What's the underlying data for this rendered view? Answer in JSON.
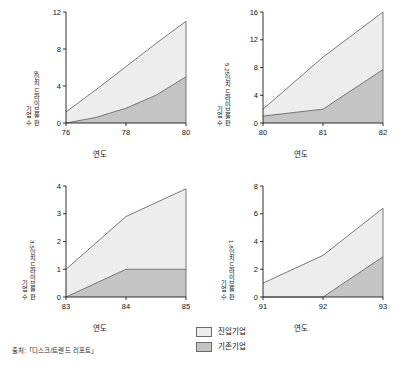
{
  "figure": {
    "source_note": "출처:「디스크/트렌드 리포트」",
    "legend": {
      "position": "bottom-center",
      "items": [
        {
          "label": "진입기업",
          "color": "#ededed",
          "key": "entrant"
        },
        {
          "label": "기존기업",
          "color": "#c4c4c4",
          "key": "incumbent"
        }
      ]
    },
    "colors": {
      "entrant_fill": "#ededed",
      "incumbent_fill": "#c4c4c4",
      "line": "#6b6b6b",
      "axis": "#1a1a1a",
      "text": "#111111"
    }
  },
  "chart_data": [
    {
      "type": "area",
      "id": "chart-8inch",
      "title": "",
      "ylabel_line1": "8인치 드라이브를 판",
      "ylabel_line2": "기업 수",
      "xlabel": "연도",
      "x": [
        76,
        77,
        78,
        79,
        80
      ],
      "xticks": [
        76,
        78,
        80
      ],
      "xticklabels": [
        "76",
        "78",
        "80"
      ],
      "yticks": [
        0,
        4,
        8,
        12
      ],
      "yticklabels": [
        "0",
        "4",
        "8",
        "12"
      ],
      "xlim": [
        76,
        80
      ],
      "ylim": [
        0,
        12
      ],
      "grid": false,
      "series": [
        {
          "name": "기존기업",
          "key": "incumbent",
          "values": [
            0.0,
            0.6,
            1.6,
            3.0,
            5.0
          ]
        },
        {
          "name": "진입기업",
          "key": "entrant",
          "values": [
            1.2,
            3.6,
            6.1,
            8.6,
            11.0
          ]
        }
      ],
      "stack_note": "entrant values are cumulative totals (top of stack)"
    },
    {
      "type": "area",
      "id": "chart-5-25inch",
      "title": "",
      "ylabel_line1": "5.25인치 드라이브를 판",
      "ylabel_line2": "기업 수",
      "xlabel": "연도",
      "x": [
        80,
        81,
        82
      ],
      "xticks": [
        80,
        81,
        82
      ],
      "xticklabels": [
        "80",
        "81",
        "82"
      ],
      "yticks": [
        0,
        4,
        8,
        12,
        16
      ],
      "yticklabels": [
        "0",
        "4",
        "8",
        "12",
        "16"
      ],
      "xlim": [
        80,
        82
      ],
      "ylim": [
        0,
        16
      ],
      "grid": false,
      "series": [
        {
          "name": "기존기업",
          "key": "incumbent",
          "values": [
            1.0,
            2.0,
            7.7
          ]
        },
        {
          "name": "진입기업",
          "key": "entrant",
          "values": [
            2.0,
            9.5,
            16.0
          ]
        }
      ],
      "stack_note": "entrant values are cumulative totals (top of stack)"
    },
    {
      "type": "area",
      "id": "chart-3-5inch",
      "title": "",
      "ylabel_line1": "3.5인치 드라이브를 판",
      "ylabel_line2": "기업 수",
      "xlabel": "연도",
      "x": [
        83,
        84,
        85
      ],
      "xticks": [
        83,
        84,
        85
      ],
      "xticklabels": [
        "83",
        "84",
        "85"
      ],
      "yticks": [
        0,
        1,
        2,
        3,
        4
      ],
      "yticklabels": [
        "0",
        "1",
        "2",
        "3",
        "4"
      ],
      "xlim": [
        83,
        85
      ],
      "ylim": [
        0,
        4
      ],
      "grid": false,
      "series": [
        {
          "name": "기존기업",
          "key": "incumbent",
          "values": [
            0.0,
            1.0,
            1.0
          ]
        },
        {
          "name": "진입기업",
          "key": "entrant",
          "values": [
            1.0,
            2.9,
            3.9
          ]
        }
      ],
      "stack_note": "entrant values are cumulative totals (top of stack)"
    },
    {
      "type": "area",
      "id": "chart-1-8inch",
      "title": "",
      "ylabel_line1": "1.8인치 드라이브를 판",
      "ylabel_line2": "기업 수",
      "xlabel": "연도",
      "x": [
        91,
        92,
        93
      ],
      "xticks": [
        91,
        92,
        93
      ],
      "xticklabels": [
        "91",
        "92",
        "93"
      ],
      "yticks": [
        0,
        2,
        4,
        6,
        8
      ],
      "yticklabels": [
        "0",
        "2",
        "4",
        "6",
        "8"
      ],
      "xlim": [
        91,
        93
      ],
      "ylim": [
        0,
        8
      ],
      "grid": false,
      "series": [
        {
          "name": "기존기업",
          "key": "incumbent",
          "values": [
            0.0,
            0.0,
            2.9
          ]
        },
        {
          "name": "진입기업",
          "key": "entrant",
          "values": [
            1.0,
            3.0,
            6.4
          ]
        }
      ],
      "stack_note": "entrant values are cumulative totals (top of stack)"
    }
  ]
}
